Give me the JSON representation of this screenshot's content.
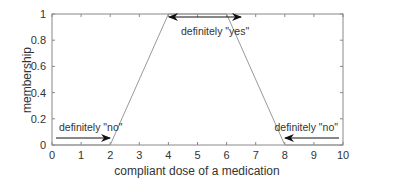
{
  "chart_data": {
    "type": "line",
    "title": "",
    "xlabel": "compliant dose of a medication",
    "ylabel": "membership",
    "xlim": [
      0,
      10
    ],
    "ylim": [
      0,
      1
    ],
    "x_ticks": [
      "0",
      "1",
      "2",
      "3",
      "4",
      "5",
      "6",
      "7",
      "8",
      "9",
      "10"
    ],
    "y_ticks": [
      "0",
      "0.2",
      "0.4",
      "0.6",
      "0.8",
      "1"
    ],
    "grid": false,
    "series": [
      {
        "name": "membership function",
        "x": [
          0,
          2,
          4,
          6,
          8,
          10
        ],
        "y": [
          0,
          0,
          1,
          1,
          0,
          0
        ]
      }
    ],
    "annotations": [
      {
        "text": "definitely \"no\"",
        "arrow": "from x=0.1 to x=1.9 at y=0.05"
      },
      {
        "text": "definitely \"yes\"",
        "arrow": "double-headed from x=4 to x=6 at y=0.97"
      },
      {
        "text": "definitely \"no\"",
        "arrow": "from x=9.9 to x=8.1 at y=0.05"
      }
    ]
  }
}
